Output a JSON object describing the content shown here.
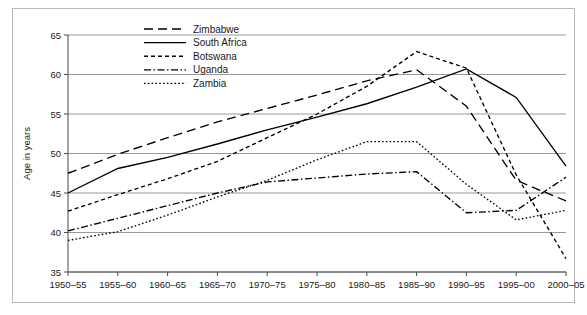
{
  "chart_data": {
    "type": "line",
    "title": "",
    "subtitle": "",
    "xlabel": "",
    "ylabel": "Age in years",
    "categories": [
      "1950–55",
      "1955–60",
      "1960–65",
      "1965–70",
      "1970–75",
      "1975–80",
      "1980–85",
      "1985–90",
      "1990–95",
      "1995–00",
      "2000–05"
    ],
    "xlim": [
      0,
      10
    ],
    "ylim": [
      35,
      65
    ],
    "yticks": [
      35,
      40,
      45,
      50,
      55,
      60,
      65
    ],
    "grid": true,
    "legend_position": "top-center",
    "series": [
      {
        "name": "Zimbabwe",
        "dash": "9,5",
        "values": [
          47.5,
          49.9,
          52.0,
          54.0,
          55.7,
          57.4,
          59.2,
          60.6,
          56.0,
          46.6,
          44.0
        ]
      },
      {
        "name": "South Africa",
        "dash": "none",
        "values": [
          45.0,
          48.1,
          49.5,
          51.2,
          53.0,
          54.6,
          56.3,
          58.4,
          60.7,
          57.1,
          48.4
        ]
      },
      {
        "name": "Botswana",
        "dash": "4,3",
        "values": [
          42.7,
          44.8,
          46.8,
          49.0,
          52.0,
          55.0,
          58.5,
          62.9,
          60.8,
          47.3,
          36.7
        ]
      },
      {
        "name": "Uganda",
        "dash": "7,2.5,1.5,2.5",
        "values": [
          40.2,
          41.8,
          43.4,
          45.0,
          46.4,
          46.9,
          47.4,
          47.7,
          42.5,
          42.8,
          47.0
        ]
      },
      {
        "name": "Zambia",
        "dash": "1.6,2.2",
        "values": [
          39.0,
          40.1,
          42.2,
          44.5,
          46.6,
          49.2,
          51.5,
          51.5,
          46.1,
          41.6,
          42.8
        ]
      }
    ]
  },
  "legend": {
    "items": [
      {
        "label": "Zimbabwe"
      },
      {
        "label": "South Africa"
      },
      {
        "label": "Botswana"
      },
      {
        "label": "Uganda"
      },
      {
        "label": "Zambia"
      }
    ]
  },
  "axes": {
    "y_title": "Age in years",
    "y_ticks": [
      "65",
      "60",
      "55",
      "50",
      "45",
      "40",
      "35"
    ],
    "x_ticks": [
      "1950–55",
      "1955–60",
      "1960–65",
      "1965–70",
      "1970–75",
      "1975–80",
      "1980–85",
      "1985–90",
      "1990–95",
      "1995–00",
      "2000–05"
    ]
  },
  "colors": {
    "line": "#000000",
    "grid": "#8c8c8c",
    "axis": "#4a4a4a",
    "frame": "#b9b9b9",
    "background": "#ffffff"
  }
}
